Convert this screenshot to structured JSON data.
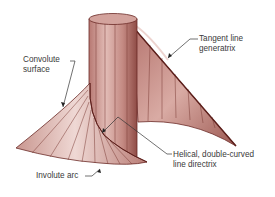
{
  "diagram": {
    "colors": {
      "surface_light": "#e6c4bf",
      "surface_mid": "#c98f88",
      "surface_dark": "#8f4a44",
      "edge": "#6b2a26",
      "leader": "#333333",
      "text": "#3a3a3a"
    },
    "labels": {
      "convolute_surface": [
        "Convolute",
        "surface"
      ],
      "tangent_line": [
        "Tangent line",
        "generatrix"
      ],
      "helical": [
        "Helical, double-curved",
        "line directrix"
      ],
      "involute_arc": "Involute arc"
    }
  }
}
